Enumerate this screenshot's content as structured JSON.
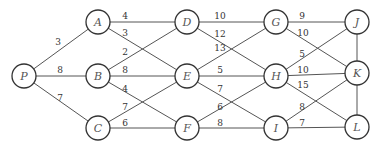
{
  "diagram": {
    "type": "weighted-graph",
    "node_radius": 12,
    "nodes": [
      {
        "id": "P",
        "label": "P",
        "x": 24,
        "y": 76
      },
      {
        "id": "A",
        "label": "A",
        "x": 98,
        "y": 22
      },
      {
        "id": "B",
        "label": "B",
        "x": 98,
        "y": 76
      },
      {
        "id": "C",
        "label": "C",
        "x": 98,
        "y": 128
      },
      {
        "id": "D",
        "label": "D",
        "x": 187,
        "y": 22
      },
      {
        "id": "E",
        "label": "E",
        "x": 187,
        "y": 76
      },
      {
        "id": "F",
        "label": "F",
        "x": 187,
        "y": 128
      },
      {
        "id": "G",
        "label": "G",
        "x": 276,
        "y": 22
      },
      {
        "id": "H",
        "label": "H",
        "x": 276,
        "y": 76
      },
      {
        "id": "I",
        "label": "I",
        "x": 276,
        "y": 128
      },
      {
        "id": "J",
        "label": "J",
        "x": 357,
        "y": 22
      },
      {
        "id": "K",
        "label": "K",
        "x": 357,
        "y": 73
      },
      {
        "id": "L",
        "label": "L",
        "x": 357,
        "y": 127
      }
    ],
    "edges": [
      {
        "from": "P",
        "to": "A",
        "weight": "3",
        "lx": 58,
        "ly": 45
      },
      {
        "from": "P",
        "to": "B",
        "weight": "8",
        "lx": 60,
        "ly": 73
      },
      {
        "from": "P",
        "to": "C",
        "weight": "7",
        "lx": 60,
        "ly": 101
      },
      {
        "from": "A",
        "to": "D",
        "weight": "4",
        "lx": 125,
        "ly": 19
      },
      {
        "from": "A",
        "to": "E",
        "weight": "3",
        "lx": 125,
        "ly": 36
      },
      {
        "from": "B",
        "to": "D",
        "weight": "2",
        "lx": 125,
        "ly": 55
      },
      {
        "from": "B",
        "to": "E",
        "weight": "8",
        "lx": 125,
        "ly": 73
      },
      {
        "from": "B",
        "to": "F",
        "weight": "4",
        "lx": 125,
        "ly": 92
      },
      {
        "from": "C",
        "to": "E",
        "weight": "7",
        "lx": 125,
        "ly": 110
      },
      {
        "from": "C",
        "to": "F",
        "weight": "6",
        "lx": 125,
        "ly": 126
      },
      {
        "from": "D",
        "to": "G",
        "weight": "10",
        "lx": 220,
        "ly": 19
      },
      {
        "from": "D",
        "to": "H",
        "weight": "12",
        "lx": 220,
        "ly": 37
      },
      {
        "from": "E",
        "to": "G",
        "weight": "13",
        "lx": 220,
        "ly": 51
      },
      {
        "from": "E",
        "to": "H",
        "weight": "5",
        "lx": 220,
        "ly": 73
      },
      {
        "from": "E",
        "to": "I",
        "weight": "7",
        "lx": 220,
        "ly": 92
      },
      {
        "from": "F",
        "to": "H",
        "weight": "6",
        "lx": 220,
        "ly": 110
      },
      {
        "from": "F",
        "to": "I",
        "weight": "8",
        "lx": 220,
        "ly": 126
      },
      {
        "from": "G",
        "to": "J",
        "weight": "9",
        "lx": 302,
        "ly": 19
      },
      {
        "from": "G",
        "to": "K",
        "weight": "10",
        "lx": 303,
        "ly": 36
      },
      {
        "from": "H",
        "to": "J",
        "weight": "5",
        "lx": 302,
        "ly": 57
      },
      {
        "from": "H",
        "to": "K",
        "weight": "10",
        "lx": 303,
        "ly": 73
      },
      {
        "from": "H",
        "to": "L",
        "weight": "15",
        "lx": 303,
        "ly": 88
      },
      {
        "from": "I",
        "to": "K",
        "weight": "8",
        "lx": 302,
        "ly": 110
      },
      {
        "from": "I",
        "to": "L",
        "weight": "7",
        "lx": 302,
        "ly": 126
      },
      {
        "from": "J",
        "to": "K",
        "weight": "",
        "lx": 0,
        "ly": 0
      },
      {
        "from": "K",
        "to": "L",
        "weight": "",
        "lx": 0,
        "ly": 0
      }
    ]
  }
}
